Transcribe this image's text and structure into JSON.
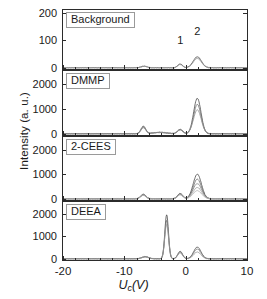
{
  "figure": {
    "ylabel": "Intensity (a. u.)",
    "xlabel_var": "U",
    "xlabel_sub": "c",
    "xlabel_unit": "(V)"
  },
  "axis": {
    "x_min": -20,
    "x_max": 10,
    "x_ticks": [
      -20,
      -10,
      0,
      10
    ],
    "x_tick_labels": [
      "-20",
      "-10",
      "0",
      "10"
    ],
    "x_minor_step": 2
  },
  "annotations": [
    {
      "text": "1",
      "x": -0.9,
      "panel": 0
    },
    {
      "text": "2",
      "x": 1.9,
      "panel": 0
    }
  ],
  "chart_data": {
    "type": "line",
    "title": "",
    "xlabel": "Uc (V)",
    "ylabel": "Intensity (a. u.)",
    "xlim": [
      -20,
      10
    ],
    "grid": false,
    "legend": "none",
    "panels": [
      {
        "label": "Background",
        "ylim": [
          0,
          200
        ],
        "y_ticks": [
          0,
          100,
          200
        ],
        "y_tick_labels": [
          "0",
          "100",
          "200"
        ],
        "peak_labels": [
          "1",
          "2"
        ],
        "series": [
          {
            "name": "background-trace-1",
            "color": "#4a4a4a",
            "peaks": [
              {
                "center": -6.8,
                "height": 6,
                "width": 0.7
              },
              {
                "center": -0.9,
                "height": 14,
                "width": 0.55
              },
              {
                "center": 1.9,
                "height": 40,
                "width": 0.95
              }
            ]
          },
          {
            "name": "background-trace-2",
            "color": "#8a8a8a",
            "peaks": [
              {
                "center": -6.8,
                "height": 5,
                "width": 0.7
              },
              {
                "center": -0.9,
                "height": 12,
                "width": 0.55
              },
              {
                "center": 1.9,
                "height": 34,
                "width": 0.95
              }
            ]
          }
        ]
      },
      {
        "label": "DMMP",
        "ylim": [
          0,
          2400
        ],
        "y_ticks": [
          0,
          1000,
          2000
        ],
        "y_tick_labels": [
          "0",
          "1000",
          "2000"
        ],
        "series": [
          {
            "name": "dmmp-trace-1",
            "color": "#4a4a4a",
            "peaks": [
              {
                "center": -6.9,
                "height": 300,
                "width": 0.55
              },
              {
                "center": -4.2,
                "height": 60,
                "width": 1.6
              },
              {
                "center": -0.9,
                "height": 175,
                "width": 0.6
              },
              {
                "center": 1.9,
                "height": 1420,
                "width": 0.85
              }
            ]
          },
          {
            "name": "dmmp-trace-2",
            "color": "#6f6f6f",
            "peaks": [
              {
                "center": -6.9,
                "height": 265,
                "width": 0.55
              },
              {
                "center": -4.2,
                "height": 55,
                "width": 1.6
              },
              {
                "center": -0.9,
                "height": 165,
                "width": 0.6
              },
              {
                "center": 1.9,
                "height": 1180,
                "width": 0.85
              }
            ]
          },
          {
            "name": "dmmp-trace-3",
            "color": "#8f8f8f",
            "peaks": [
              {
                "center": -6.9,
                "height": 240,
                "width": 0.55
              },
              {
                "center": -4.2,
                "height": 50,
                "width": 1.6
              },
              {
                "center": -0.9,
                "height": 150,
                "width": 0.6
              },
              {
                "center": 1.9,
                "height": 960,
                "width": 0.9
              }
            ]
          }
        ]
      },
      {
        "label": "2-CEES",
        "ylim": [
          0,
          2400
        ],
        "y_ticks": [
          0,
          1000,
          2000
        ],
        "y_tick_labels": [
          "0",
          "1000",
          "2000"
        ],
        "series": [
          {
            "name": "2cees-trace-1",
            "color": "#4a4a4a",
            "peaks": [
              {
                "center": -6.9,
                "height": 185,
                "width": 0.6
              },
              {
                "center": -0.9,
                "height": 215,
                "width": 0.6
              },
              {
                "center": 1.9,
                "height": 1000,
                "width": 0.95
              }
            ]
          },
          {
            "name": "2cees-trace-2",
            "color": "#6a6a6a",
            "peaks": [
              {
                "center": -6.9,
                "height": 170,
                "width": 0.6
              },
              {
                "center": -0.9,
                "height": 200,
                "width": 0.6
              },
              {
                "center": 1.9,
                "height": 800,
                "width": 0.95
              }
            ]
          },
          {
            "name": "2cees-trace-3",
            "color": "#828282",
            "peaks": [
              {
                "center": -6.9,
                "height": 160,
                "width": 0.6
              },
              {
                "center": -0.9,
                "height": 190,
                "width": 0.6
              },
              {
                "center": 1.9,
                "height": 620,
                "width": 1.0
              }
            ]
          },
          {
            "name": "2cees-trace-4",
            "color": "#9a9a9a",
            "peaks": [
              {
                "center": -6.9,
                "height": 150,
                "width": 0.6
              },
              {
                "center": -0.9,
                "height": 175,
                "width": 0.6
              },
              {
                "center": 1.9,
                "height": 460,
                "width": 1.0
              }
            ]
          },
          {
            "name": "2cees-trace-5",
            "color": "#adadad",
            "peaks": [
              {
                "center": -6.9,
                "height": 140,
                "width": 0.6
              },
              {
                "center": -0.9,
                "height": 160,
                "width": 0.6
              },
              {
                "center": 1.9,
                "height": 330,
                "width": 1.0
              }
            ]
          }
        ]
      },
      {
        "label": "DEEA",
        "ylim": [
          0,
          2400
        ],
        "y_ticks": [
          0,
          1000,
          2000
        ],
        "y_tick_labels": [
          "0",
          "1000",
          "2000"
        ],
        "series": [
          {
            "name": "deea-trace-1",
            "color": "#4a4a4a",
            "peaks": [
              {
                "center": -6.6,
                "height": 95,
                "width": 0.8
              },
              {
                "center": -3.1,
                "height": 1960,
                "width": 0.42
              },
              {
                "center": -0.9,
                "height": 330,
                "width": 0.55
              },
              {
                "center": 1.9,
                "height": 520,
                "width": 0.85
              }
            ]
          },
          {
            "name": "deea-trace-2",
            "color": "#747474",
            "peaks": [
              {
                "center": -6.6,
                "height": 85,
                "width": 0.8
              },
              {
                "center": -3.1,
                "height": 1700,
                "width": 0.42
              },
              {
                "center": -0.9,
                "height": 300,
                "width": 0.55
              },
              {
                "center": 1.9,
                "height": 430,
                "width": 0.85
              }
            ]
          },
          {
            "name": "deea-trace-3",
            "color": "#949494",
            "peaks": [
              {
                "center": -6.6,
                "height": 80,
                "width": 0.8
              },
              {
                "center": -3.1,
                "height": 1520,
                "width": 0.45
              },
              {
                "center": -0.9,
                "height": 265,
                "width": 0.55
              },
              {
                "center": 1.9,
                "height": 300,
                "width": 0.85
              }
            ]
          }
        ]
      }
    ]
  }
}
